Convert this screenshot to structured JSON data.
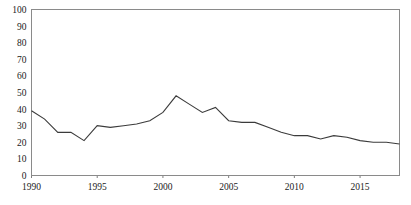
{
  "chart_data": {
    "type": "line",
    "title": "",
    "subtitle": "",
    "xlabel": "",
    "ylabel": "",
    "xlim": [
      1990,
      2018
    ],
    "ylim": [
      0,
      100
    ],
    "grid": false,
    "legend": "none",
    "line_color": "#3b3b3b",
    "frame_color": "#8a8a8a",
    "background_color": "#ffffff",
    "y_ticks": [
      0,
      10,
      20,
      30,
      40,
      50,
      60,
      70,
      80,
      90,
      100
    ],
    "y_tick_labels": [
      "0",
      "10",
      "20",
      "30",
      "40",
      "50",
      "60",
      "70",
      "80",
      "90",
      "100"
    ],
    "x_ticks": [
      1990,
      1995,
      2000,
      2005,
      2010,
      2015
    ],
    "x_tick_labels": [
      "1990",
      "1995",
      "2000",
      "2005",
      "2010",
      "2015"
    ],
    "series": [
      {
        "name": "series-1",
        "x": [
          1990,
          1991,
          1992,
          1993,
          1994,
          1995,
          1996,
          1997,
          1998,
          1999,
          2000,
          2001,
          2002,
          2003,
          2004,
          2005,
          2006,
          2007,
          2008,
          2009,
          2010,
          2011,
          2012,
          2013,
          2014,
          2015,
          2016,
          2017,
          2018
        ],
        "values": [
          39,
          34,
          26,
          26,
          21,
          30,
          29,
          30,
          31,
          33,
          38,
          48,
          43,
          38,
          41,
          33,
          32,
          32,
          29,
          26,
          24,
          24,
          22,
          24,
          23,
          21,
          20,
          20,
          19
        ]
      }
    ]
  }
}
